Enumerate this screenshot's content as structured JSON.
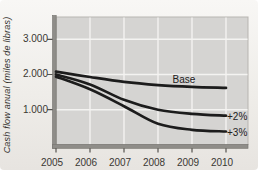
{
  "colors": {
    "bg_top": "#f8f7f5",
    "bg_bottom": "#e7e4e0",
    "plot_fill": "#d5d4d2",
    "plot_outline": "#b7b5b1",
    "grid": "#f4f3f1",
    "axis_band": "#8f8d89",
    "axis_band_edge": "#7a7874",
    "tick": "#55534f",
    "line": "#1c1c1c",
    "text": "#3a3833"
  },
  "chart_data": {
    "type": "line",
    "ylabel": "Cash flow anual (miles de libras)",
    "xlabel": "",
    "categories": [
      "2005",
      "2006",
      "2007",
      "2008",
      "2009",
      "2010"
    ],
    "y_ticks": [
      "3.000",
      "2.000",
      "1.000"
    ],
    "y_tick_values": [
      3000,
      2000,
      1000
    ],
    "ylim": [
      0,
      3640
    ],
    "grid": true,
    "legend_position": "inline-labels",
    "series": [
      {
        "name": "Base",
        "values": [
          2080,
          1930,
          1790,
          1700,
          1650,
          1620
        ]
      },
      {
        "name": "+2%",
        "values": [
          2000,
          1720,
          1280,
          1000,
          880,
          830
        ]
      },
      {
        "name": "+3%",
        "values": [
          1940,
          1580,
          1100,
          600,
          430,
          380
        ]
      }
    ]
  }
}
